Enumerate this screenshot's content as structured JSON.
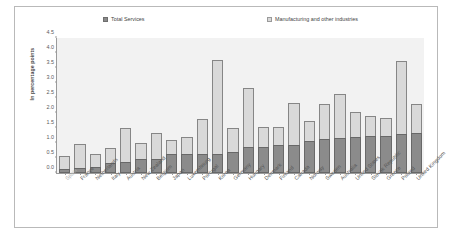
{
  "legend": {
    "series_services_label": "Total Services",
    "series_manufacturing_label": "Manufacturing and other industries"
  },
  "axes": {
    "ylabel": "In percentage points",
    "yticks": [
      "0.0",
      "0.5",
      "1.0",
      "1.5",
      "2.0",
      "2.5",
      "3.0",
      "3.5",
      "4.0",
      "4.5"
    ]
  },
  "colors": {
    "services": "#8b8b8b",
    "manufacturing": "#d9d9d9",
    "plot_background": "#f2f2f2",
    "axis": "#9b9b9b",
    "frame": "#b9b9b9",
    "text": "#555555",
    "muted_text": "#b0b0b0"
  },
  "chart_data": {
    "type": "bar",
    "title": "",
    "xlabel": "",
    "ylabel": "In percentage points",
    "ylim": [
      0,
      4.5
    ],
    "ytick_step": 0.5,
    "grid": false,
    "stacked": true,
    "legend_position": "top",
    "categories": [
      "Spain",
      "France",
      "Netherlands",
      "Italy",
      "Austria",
      "New Zealand",
      "Belgium",
      "Japan",
      "Luxembourg",
      "Portugal",
      "Korea",
      "Germany",
      "Hungary",
      "Denmark",
      "Finland",
      "Canada",
      "Norway",
      "Sweden",
      "Australia",
      "United States",
      "Slovak Republic",
      "Greece",
      "Poland",
      "United Kingdom"
    ],
    "series": [
      {
        "name": "Total Services",
        "values": [
          0.13,
          0.17,
          0.21,
          0.32,
          0.38,
          0.47,
          0.48,
          0.63,
          0.63,
          0.63,
          0.64,
          0.7,
          0.87,
          0.87,
          0.92,
          0.95,
          1.06,
          1.12,
          1.17,
          1.2,
          1.22,
          1.23,
          1.29,
          1.33
        ]
      },
      {
        "name": "Manufacturing and other industries",
        "values": [
          0.43,
          0.8,
          0.42,
          0.53,
          1.13,
          0.52,
          0.87,
          0.48,
          0.58,
          1.17,
          3.14,
          0.81,
          1.97,
          0.67,
          0.62,
          1.39,
          0.66,
          1.17,
          1.46,
          0.84,
          0.68,
          0.59,
          2.45,
          0.97
        ]
      }
    ],
    "totals": [
      0.56,
      0.97,
      0.63,
      0.85,
      1.51,
      0.99,
      1.35,
      1.11,
      1.21,
      1.8,
      3.78,
      1.51,
      2.84,
      1.54,
      1.54,
      2.34,
      1.72,
      2.29,
      2.63,
      2.04,
      1.9,
      1.82,
      3.74,
      2.3
    ]
  }
}
